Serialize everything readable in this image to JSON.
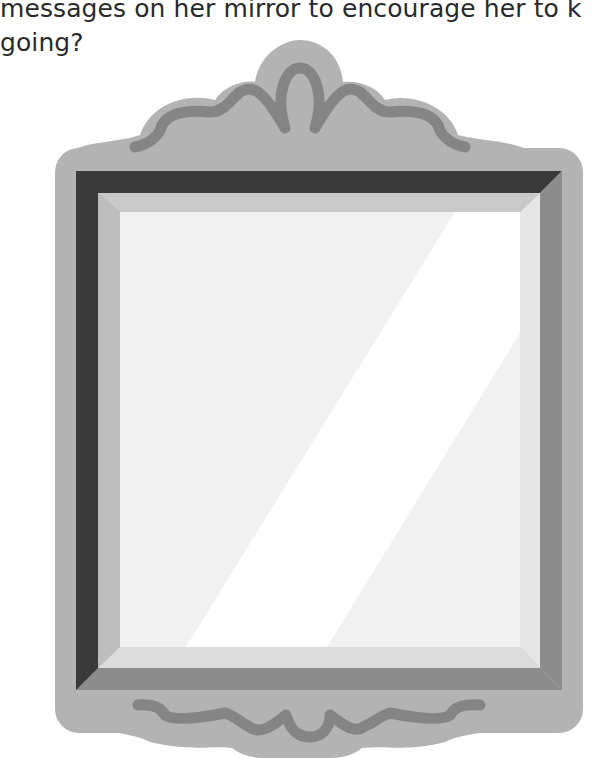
{
  "question": {
    "line1": "messages on her mirror to encourage her to k",
    "line2": "going?"
  },
  "illustration": {
    "name": "mirror",
    "colors": {
      "frame_outer": "#b3b3b3",
      "frame_ornament": "#858585",
      "frame_dark": "#3a3a3a",
      "frame_mid": "#8c8c8c",
      "bevel_light": "#d6d6d6",
      "bevel_lighter": "#e3e3e3",
      "glass": "#f1f1f1",
      "glass_shine": "#ffffff"
    }
  }
}
